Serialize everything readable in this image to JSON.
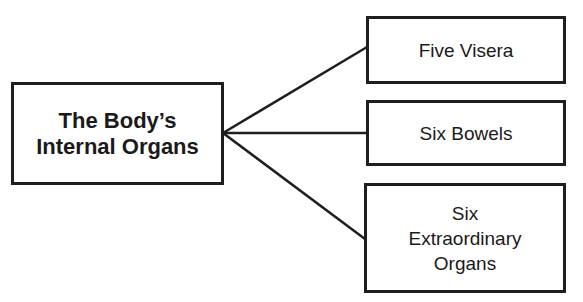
{
  "diagram": {
    "root": {
      "label": "The Body’s\nInternal Organs"
    },
    "children": [
      {
        "label": "Five Visera"
      },
      {
        "label": "Six Bowels"
      },
      {
        "label": "Six\nExtraordinary\nOrgans"
      }
    ],
    "colors": {
      "stroke": "#1e1e1e",
      "background": "#ffffff"
    }
  }
}
